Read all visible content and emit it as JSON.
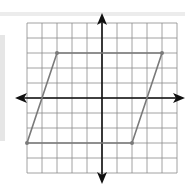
{
  "figure": {
    "title": "",
    "grid": {
      "x_min": -5,
      "x_max": 5,
      "y_min": -5,
      "y_max": 5,
      "cell_px": 15
    },
    "axes": {
      "x_arrows": true,
      "y_arrows": true
    },
    "colors": {
      "grid": "#8a8a8a",
      "axis": "#111111",
      "shape": "#7a7a7a",
      "background": "#ffffff"
    },
    "shape": {
      "type": "parallelogram",
      "vertices": [
        {
          "label": "",
          "x": -3,
          "y": 3
        },
        {
          "label": "",
          "x": 4,
          "y": 3
        },
        {
          "label": "",
          "x": 2,
          "y": -3
        },
        {
          "label": "",
          "x": -5,
          "y": -3
        }
      ]
    }
  }
}
